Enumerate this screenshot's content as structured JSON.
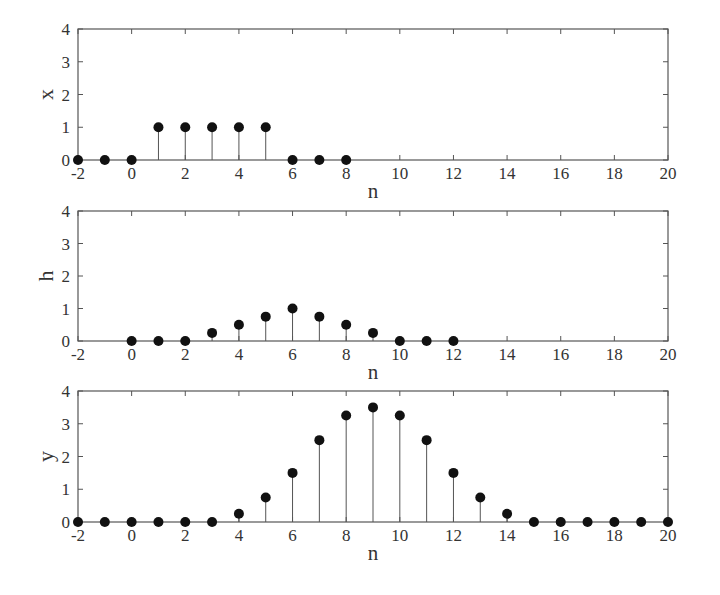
{
  "chart_data": [
    {
      "type": "stem",
      "title": "",
      "xlabel": "n",
      "ylabel": "x",
      "xlim": [
        -2,
        20
      ],
      "ylim": [
        0,
        4
      ],
      "xticks": [
        -2,
        0,
        2,
        4,
        6,
        8,
        10,
        12,
        14,
        16,
        18,
        20
      ],
      "yticks": [
        0,
        1,
        2,
        3,
        4
      ],
      "grid": false,
      "x": [
        -2,
        -1,
        0,
        1,
        2,
        3,
        4,
        5,
        6,
        7,
        8
      ],
      "values": [
        0,
        0,
        0,
        1,
        1,
        1,
        1,
        1,
        0,
        0,
        0
      ]
    },
    {
      "type": "stem",
      "title": "",
      "xlabel": "n",
      "ylabel": "h",
      "xlim": [
        -2,
        20
      ],
      "ylim": [
        0,
        4
      ],
      "xticks": [
        -2,
        0,
        2,
        4,
        6,
        8,
        10,
        12,
        14,
        16,
        18,
        20
      ],
      "yticks": [
        0,
        1,
        2,
        3,
        4
      ],
      "grid": false,
      "x": [
        0,
        1,
        2,
        3,
        4,
        5,
        6,
        7,
        8,
        9,
        10,
        11,
        12
      ],
      "values": [
        0,
        0,
        0,
        0.25,
        0.5,
        0.75,
        1,
        0.75,
        0.5,
        0.25,
        0,
        0,
        0
      ]
    },
    {
      "type": "stem",
      "title": "",
      "xlabel": "n",
      "ylabel": "y",
      "xlim": [
        -2,
        20
      ],
      "ylim": [
        0,
        4
      ],
      "xticks": [
        -2,
        0,
        2,
        4,
        6,
        8,
        10,
        12,
        14,
        16,
        18,
        20
      ],
      "yticks": [
        0,
        1,
        2,
        3,
        4
      ],
      "grid": false,
      "x": [
        -2,
        -1,
        0,
        1,
        2,
        3,
        4,
        5,
        6,
        7,
        8,
        9,
        10,
        11,
        12,
        13,
        14,
        15,
        16,
        17,
        18,
        19,
        20
      ],
      "values": [
        0,
        0,
        0,
        0,
        0,
        0,
        0.25,
        0.75,
        1.5,
        2.5,
        3.25,
        3.5,
        3.25,
        2.5,
        1.5,
        0.75,
        0.25,
        0,
        0,
        0,
        0,
        0,
        0
      ]
    }
  ],
  "style": {
    "axis_color": "#555555",
    "stem_color": "#555555",
    "marker_color": "#111111"
  }
}
